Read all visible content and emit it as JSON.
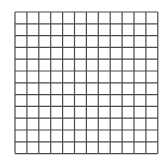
{
  "grid": {
    "rows": 12,
    "cols": 12,
    "cell_width": 11.9,
    "cell_height": 11.8,
    "line_color": "#4a4a4a",
    "background": "#ffffff"
  }
}
